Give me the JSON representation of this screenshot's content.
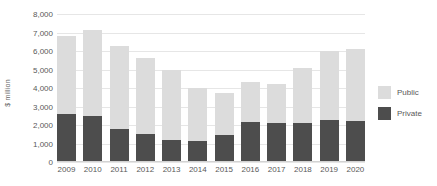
{
  "chart_data": {
    "type": "bar",
    "stacked": true,
    "title": "",
    "subtitle": "",
    "xlabel": "",
    "ylabel": "$ million",
    "categories": [
      "2009",
      "2010",
      "2011",
      "2012",
      "2013",
      "2014",
      "2015",
      "2016",
      "2017",
      "2018",
      "2019",
      "2020"
    ],
    "series": [
      {
        "name": "Private",
        "color": "#4d4d4d",
        "values": [
          2600,
          2480,
          1780,
          1510,
          1190,
          1130,
          1460,
          2160,
          2110,
          2110,
          2270,
          2220
        ]
      },
      {
        "name": "Public",
        "color": "#dcdcdc",
        "values": [
          4210,
          4650,
          4490,
          4110,
          3780,
          2870,
          2270,
          2160,
          2110,
          2970,
          3730,
          3890
        ]
      }
    ],
    "totals": [
      6810,
      7130,
      6270,
      5620,
      4970,
      4000,
      3730,
      4320,
      4220,
      5080,
      6000,
      6110
    ],
    "ylim": [
      0,
      8000
    ],
    "ytick_values": [
      8000,
      7000,
      6000,
      5000,
      4000,
      3000,
      2000,
      1000,
      0
    ],
    "ytick_labels": [
      "8,000",
      "7,000",
      "6,000",
      "5,000",
      "4,000",
      "3,000",
      "2,000",
      "1,000",
      "0"
    ],
    "grid": true,
    "legend_position": "right",
    "legend": [
      {
        "label": "Public",
        "color": "#dcdcdc"
      },
      {
        "label": "Private",
        "color": "#4d4d4d"
      }
    ]
  }
}
